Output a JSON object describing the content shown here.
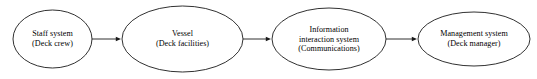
{
  "diagram": {
    "type": "flow-chain",
    "canvas": {
      "width": 537,
      "height": 79,
      "background": "#ffffff"
    },
    "stroke_color": "#1a1a1a",
    "text_color": "#000000",
    "nodes": [
      {
        "id": "staff-system",
        "shape": "ellipse",
        "cx": 52.5,
        "cy": 39,
        "rx": 39.5,
        "ry": 29,
        "lines": [
          "Staff system",
          "(Deck crew)"
        ]
      },
      {
        "id": "vessel",
        "shape": "ellipse",
        "cx": 182.5,
        "cy": 39,
        "rx": 60.5,
        "ry": 33,
        "lines": [
          "Vessel",
          "(Deck facilities)"
        ]
      },
      {
        "id": "information-interaction-system",
        "shape": "ellipse",
        "cx": 329,
        "cy": 39,
        "rx": 57,
        "ry": 31,
        "lines": [
          "Information",
          "interaction system",
          "(Communications)"
        ]
      },
      {
        "id": "management-system",
        "shape": "ellipse",
        "cx": 474,
        "cy": 39,
        "rx": 56,
        "ry": 27,
        "lines": [
          "Management system",
          "(Deck manager)"
        ]
      }
    ],
    "connectors": [
      {
        "id": "staff-to-vessel",
        "from": "staff-system",
        "to": "vessel",
        "x1": 92,
        "x2": 121,
        "y": 39,
        "direction": "right"
      },
      {
        "id": "vessel-to-information",
        "from": "vessel",
        "to": "information-interaction-system",
        "x1": 243,
        "x2": 271,
        "y": 39,
        "direction": "right"
      },
      {
        "id": "information-to-management",
        "from": "information-interaction-system",
        "to": "management-system",
        "x1": 386,
        "x2": 417,
        "y": 39,
        "direction": "right"
      }
    ]
  }
}
